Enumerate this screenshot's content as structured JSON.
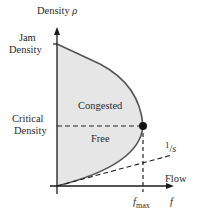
{
  "diagram": {
    "y_axis": {
      "label": "Density",
      "symbol": "ρ"
    },
    "x_axis": {
      "label": "Flow",
      "symbol": "f"
    },
    "y_ticks": {
      "jam": [
        "Jam",
        "Density"
      ],
      "critical": [
        "Critical",
        "Density"
      ]
    },
    "x_ticks": {
      "fmax_base": "f",
      "fmax_sub": "max"
    },
    "regions": {
      "congested": "Congested",
      "free": "Free"
    },
    "slope_label": {
      "num": "1",
      "den": "s"
    },
    "colors": {
      "fill": "#e6e6e6",
      "curve": "#555555",
      "axis": "#1a1a1a",
      "dot": "#111111"
    }
  }
}
